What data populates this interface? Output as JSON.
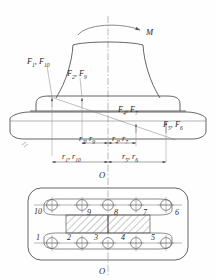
{
  "figure": {
    "moment_label": "M",
    "axis_label_top": "O",
    "axis_label_bottom": "O"
  },
  "force_labels": [
    {
      "id": "f1-f10",
      "base": "F",
      "subs": [
        "1",
        "10"
      ],
      "text": "F1, F10"
    },
    {
      "id": "f2-f9",
      "base": "F",
      "subs": [
        "2",
        "9"
      ],
      "text": "F2, F9"
    },
    {
      "id": "f4-f7",
      "base": "F",
      "subs": [
        "4",
        "7"
      ],
      "text": "F4, F7"
    },
    {
      "id": "f5-f6",
      "base": "F",
      "subs": [
        "5",
        "6"
      ],
      "text": "F5, F6"
    }
  ],
  "dimension_labels": [
    {
      "id": "r2-r9",
      "base": "r",
      "subs": [
        "2",
        "9"
      ],
      "text": "r2, r9"
    },
    {
      "id": "r4-r7",
      "base": "r",
      "subs": [
        "4",
        "7"
      ],
      "text": "r4, r7"
    },
    {
      "id": "r1-r10",
      "base": "r",
      "subs": [
        "1",
        "10"
      ],
      "text": "r1, r10"
    },
    {
      "id": "r5-r6",
      "base": "r",
      "subs": [
        "5",
        "6"
      ],
      "text": "r5, r6"
    }
  ],
  "bolt_numbers": {
    "top_row": [
      "10",
      "9",
      "8",
      "7",
      "6"
    ],
    "bottom_row": [
      "1",
      "2",
      "3",
      "4",
      "5"
    ]
  },
  "colors": {
    "line": "#4a4a4a",
    "thin_line": "#7a7a7a",
    "center_line": "#8a8a8a",
    "text": "#2a2a2a",
    "background": "#ffffff"
  },
  "chart_data": {
    "type": "diagram",
    "bolt_count": 10,
    "symmetry_axis_x": 108
  }
}
